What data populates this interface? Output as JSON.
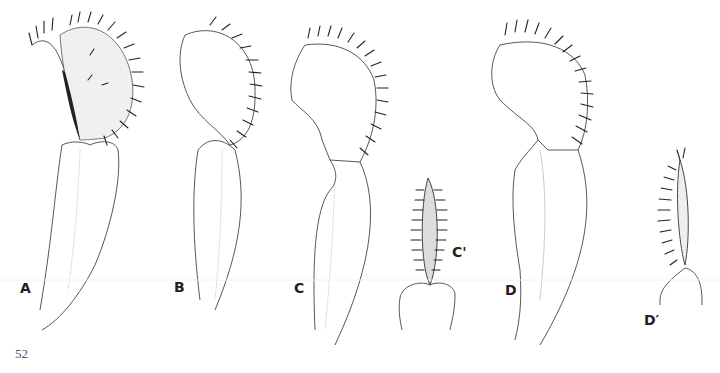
{
  "figure": {
    "panels": [
      {
        "id": "A",
        "label": "A"
      },
      {
        "id": "B",
        "label": "B"
      },
      {
        "id": "C",
        "label": "C"
      },
      {
        "id": "C_prime",
        "label": "C'"
      },
      {
        "id": "D",
        "label": "D"
      },
      {
        "id": "D_prime",
        "label": "D′"
      }
    ]
  },
  "page": {
    "number": "52"
  }
}
